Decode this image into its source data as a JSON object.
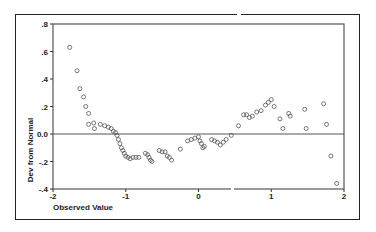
{
  "chart_data": {
    "type": "scatter",
    "title": "",
    "xlabel": "Observed Value",
    "ylabel": "Dev from Normal",
    "xlim": [
      -2,
      2
    ],
    "ylim": [
      -0.4,
      0.8
    ],
    "xticks": [
      "-2",
      "-1",
      "0",
      "1",
      "2"
    ],
    "yticks": [
      ".8",
      ".6",
      ".4",
      ".2",
      "0.0",
      "-.2",
      "-.4"
    ],
    "reference_line_y": 0.0,
    "marker": "open-circle",
    "points": [
      [
        -1.77,
        0.63
      ],
      [
        -1.67,
        0.46
      ],
      [
        -1.63,
        0.33
      ],
      [
        -1.58,
        0.27
      ],
      [
        -1.55,
        0.2
      ],
      [
        -1.51,
        0.15
      ],
      [
        -1.51,
        0.07
      ],
      [
        -1.44,
        0.08
      ],
      [
        -1.43,
        0.04
      ],
      [
        -1.35,
        0.07
      ],
      [
        -1.29,
        0.06
      ],
      [
        -1.24,
        0.05
      ],
      [
        -1.2,
        0.04
      ],
      [
        -1.17,
        0.02
      ],
      [
        -1.14,
        0.01
      ],
      [
        -1.12,
        -0.01
      ],
      [
        -1.1,
        -0.04
      ],
      [
        -1.08,
        -0.07
      ],
      [
        -1.06,
        -0.1
      ],
      [
        -1.04,
        -0.12
      ],
      [
        -1.02,
        -0.14
      ],
      [
        -1.0,
        -0.16
      ],
      [
        -0.97,
        -0.17
      ],
      [
        -0.94,
        -0.18
      ],
      [
        -0.9,
        -0.17
      ],
      [
        -0.86,
        -0.17
      ],
      [
        -0.82,
        -0.17
      ],
      [
        -0.73,
        -0.14
      ],
      [
        -0.7,
        -0.15
      ],
      [
        -0.68,
        -0.17
      ],
      [
        -0.66,
        -0.19
      ],
      [
        -0.64,
        -0.2
      ],
      [
        -0.54,
        -0.12
      ],
      [
        -0.5,
        -0.13
      ],
      [
        -0.46,
        -0.13
      ],
      [
        -0.43,
        -0.16
      ],
      [
        -0.4,
        -0.17
      ],
      [
        -0.37,
        -0.19
      ],
      [
        -0.25,
        -0.11
      ],
      [
        -0.15,
        -0.05
      ],
      [
        -0.1,
        -0.04
      ],
      [
        -0.05,
        -0.03
      ],
      [
        0.0,
        -0.02
      ],
      [
        0.02,
        -0.05
      ],
      [
        0.04,
        -0.07
      ],
      [
        0.06,
        -0.1
      ],
      [
        0.08,
        -0.09
      ],
      [
        0.18,
        -0.04
      ],
      [
        0.22,
        -0.05
      ],
      [
        0.26,
        -0.06
      ],
      [
        0.3,
        -0.08
      ],
      [
        0.34,
        -0.06
      ],
      [
        0.38,
        -0.04
      ],
      [
        0.45,
        -0.01
      ],
      [
        0.55,
        0.06
      ],
      [
        0.62,
        0.14
      ],
      [
        0.66,
        0.14
      ],
      [
        0.7,
        0.12
      ],
      [
        0.74,
        0.13
      ],
      [
        0.8,
        0.16
      ],
      [
        0.86,
        0.17
      ],
      [
        0.92,
        0.21
      ],
      [
        0.96,
        0.23
      ],
      [
        1.0,
        0.25
      ],
      [
        1.04,
        0.2
      ],
      [
        1.12,
        0.11
      ],
      [
        1.16,
        0.04
      ],
      [
        1.24,
        0.15
      ],
      [
        1.26,
        0.13
      ],
      [
        1.46,
        0.18
      ],
      [
        1.48,
        0.04
      ],
      [
        1.72,
        0.22
      ],
      [
        1.76,
        0.07
      ],
      [
        1.82,
        -0.16
      ],
      [
        1.9,
        -0.36
      ]
    ]
  }
}
